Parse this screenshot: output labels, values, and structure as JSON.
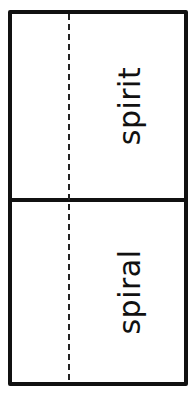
{
  "card": {
    "panels": [
      {
        "word": "spirit"
      },
      {
        "word": "spiral"
      }
    ]
  },
  "colors": {
    "border": "#111111",
    "background": "#ffffff",
    "fold_line": "#222222",
    "text": "#111111"
  }
}
